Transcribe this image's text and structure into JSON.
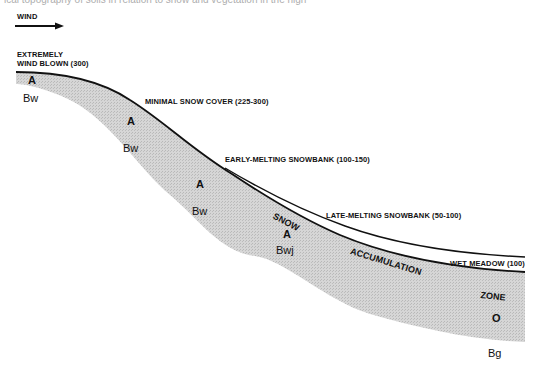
{
  "figure": {
    "cropped_caption": "ical topography of soils in relation to snow and vegetation in the high",
    "wind": {
      "label": "WIND",
      "icon": "arrow-right-icon"
    },
    "zones": [
      {
        "label": "EXTREMELY",
        "label2": "WIND BLOWN (300)"
      },
      {
        "label": "MINIMAL SNOW COVER (225-300)"
      },
      {
        "label": "EARLY-MELTING SNOWBANK (100-150)"
      },
      {
        "label": "LATE-MELTING SNOWBANK (50-100)"
      },
      {
        "label": "WET MEADOW (100)"
      }
    ],
    "accumulation_zone": {
      "words": [
        "SNOW",
        "ACCUMULATION",
        "ZONE"
      ]
    },
    "horizons": [
      {
        "top": "A",
        "bottom": "Bw"
      },
      {
        "top": "A",
        "bottom": "Bw"
      },
      {
        "top": "A",
        "bottom": "Bw"
      },
      {
        "top": "A",
        "bottom": "Bwj"
      },
      {
        "top": "O",
        "bottom": "Bg"
      }
    ],
    "colors": {
      "line": "#111111",
      "soil_fill": "#cfcfcf",
      "background": "#ffffff"
    }
  }
}
